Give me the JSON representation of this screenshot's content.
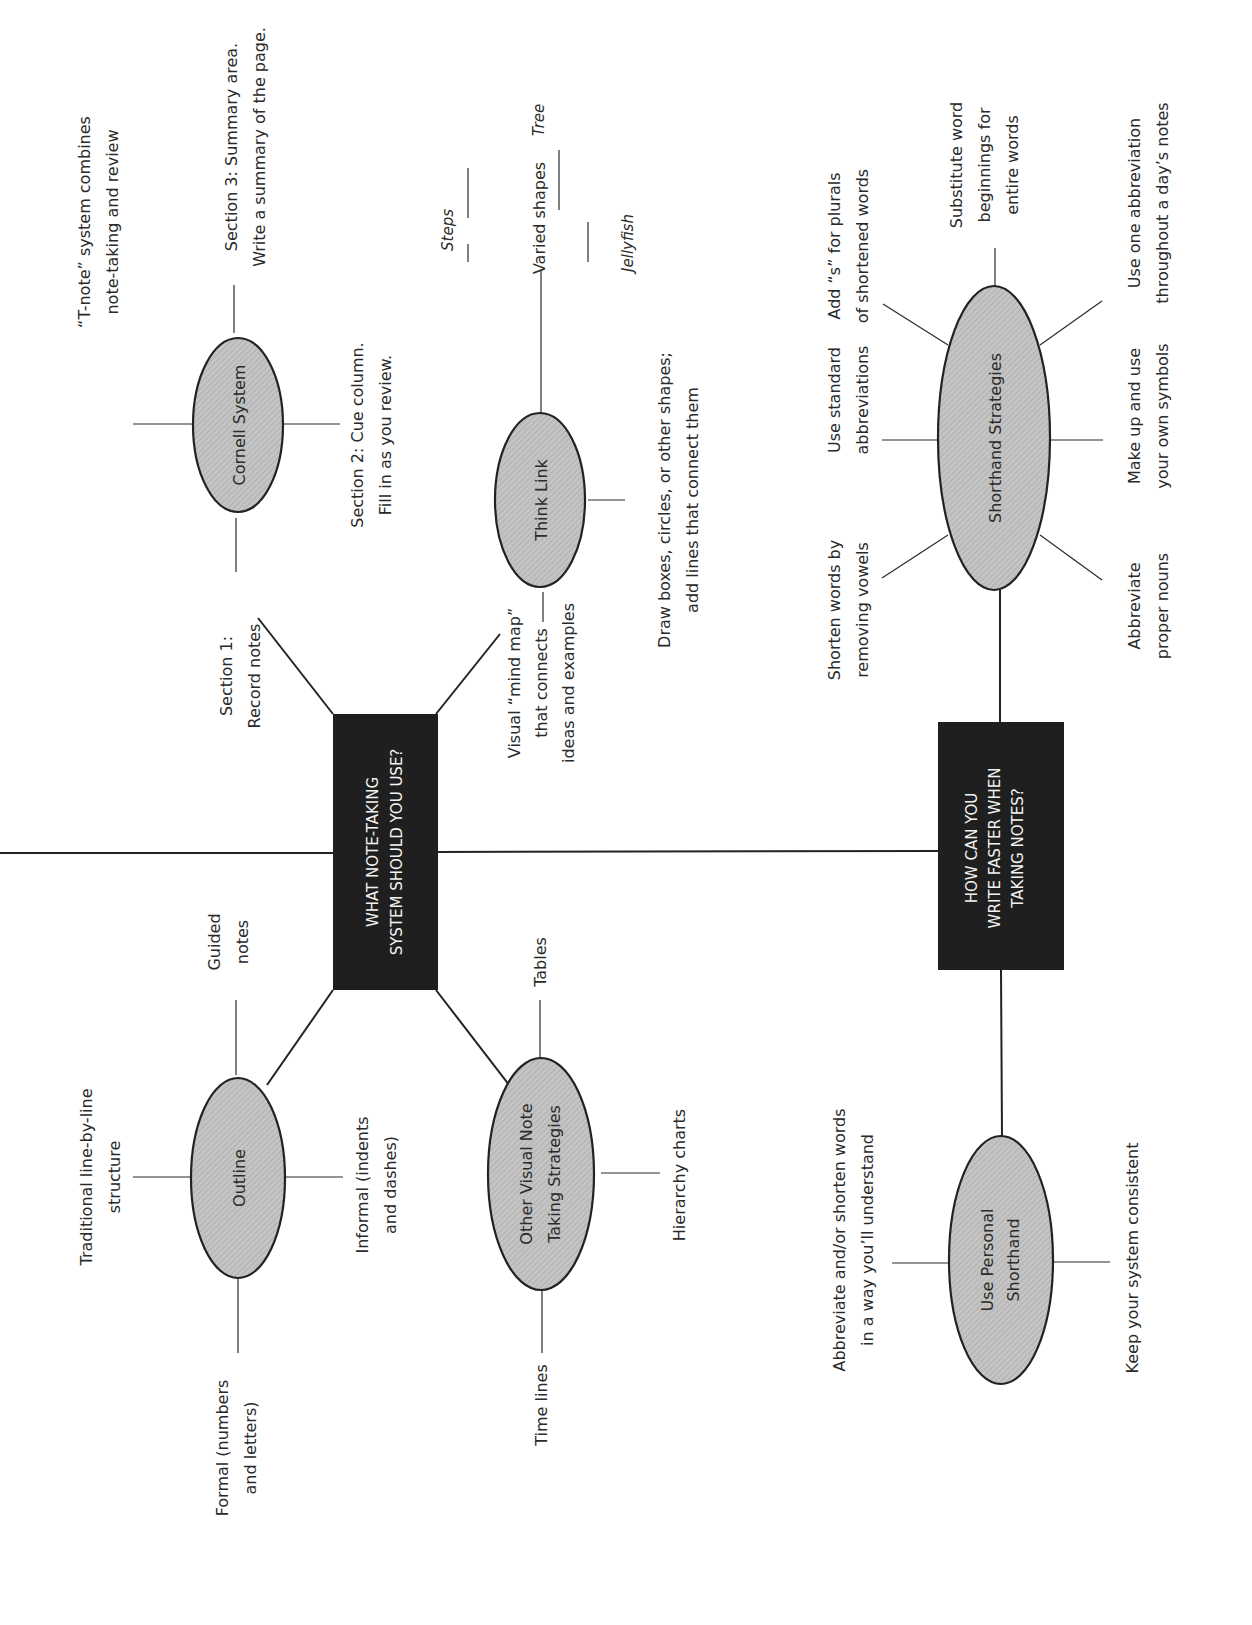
{
  "diagram": {
    "type": "mind-map",
    "orientation": "rotated-90-ccw",
    "colors": {
      "box": "#1f1f1f",
      "box_text": "#f2f2f2",
      "oval_fill": "#bdbdbd",
      "line": "#2a2a2a",
      "text": "#2a2a2a"
    },
    "hub1": {
      "label_lines": [
        "WHAT NOTE-TAKING",
        "SYSTEM SHOULD YOU USE?"
      ],
      "branches": {
        "cornell": {
          "label": "Cornell System",
          "leaves": {
            "tnote": [
              "“T-note” system combines",
              "note-taking and review"
            ],
            "section1": [
              "Section 1:",
              "Record notes"
            ],
            "section2": [
              "Section 2: Cue column.",
              "Fill in as you review."
            ],
            "section3": [
              "Section 3: Summary area.",
              "Write a summary of the page."
            ]
          }
        },
        "thinklink": {
          "label": "Think Link",
          "leaves": {
            "mindmap": [
              "Visual “mind map”",
              "that connects",
              "ideas and examples"
            ],
            "draw": [
              "Draw boxes, circles, or other shapes;",
              "add lines that connect them"
            ],
            "varied": "Varied shapes",
            "steps": "Steps",
            "tree": "Tree",
            "jellyfish": "Jellyfish"
          }
        },
        "outline": {
          "label": "Outline",
          "leaves": {
            "traditional": [
              "Traditional line-by-line",
              "structure"
            ],
            "guided": [
              "Guided",
              "notes"
            ],
            "informal": [
              "Informal (indents",
              "and dashes)"
            ],
            "formal": [
              "Formal (numbers",
              "and letters)"
            ]
          }
        },
        "othervisual": {
          "label_lines": [
            "Other Visual Note",
            "Taking Strategies"
          ],
          "leaves": {
            "tables": "Tables",
            "hierarchy": "Hierarchy charts",
            "timelines": "Time lines"
          }
        }
      }
    },
    "hub2": {
      "label_lines": [
        "HOW CAN YOU",
        "WRITE FASTER WHEN",
        "TAKING NOTES?"
      ],
      "branches": {
        "shorthand": {
          "label": "Shorthand Strategies",
          "leaves": {
            "vowels": [
              "Shorten words by",
              "removing vowels"
            ],
            "standard": [
              "Use standard",
              "abbreviations"
            ],
            "plurals": [
              "Add “s” for plurals",
              "of shortened words"
            ],
            "substitute": [
              "Substitute word",
              "beginnings for",
              "entire words"
            ],
            "oneabbr": [
              "Use one abbreviation",
              "throughout a day’s notes"
            ],
            "symbols": [
              "Make up and use",
              "your own symbols"
            ],
            "proper": [
              "Abbreviate",
              "proper nouns"
            ]
          }
        },
        "personal": {
          "label_lines": [
            "Use Personal",
            "Shorthand"
          ],
          "leaves": {
            "abbreviate": [
              "Abbreviate and/or shorten words",
              "in a way you’ll understand"
            ],
            "consistent": "Keep your system consistent"
          }
        }
      }
    }
  }
}
